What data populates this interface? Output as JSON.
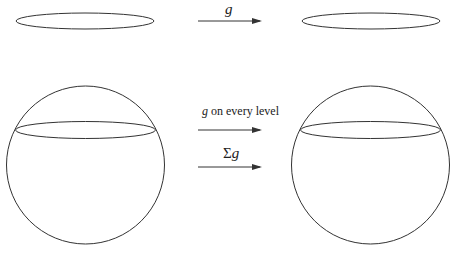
{
  "top_row": {
    "arrow_label": "g"
  },
  "bottom_row": {
    "arrow1_label_var": "g",
    "arrow1_label_text": " on every level",
    "arrow2_label_sigma": "Σ",
    "arrow2_label_var": "g"
  },
  "colors": {
    "stroke": "#333333",
    "background": "#ffffff"
  }
}
